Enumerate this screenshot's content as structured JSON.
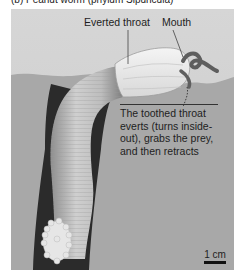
{
  "figure": {
    "cut_caption": "(b) Peanut worm (phylum Sipuncula)",
    "labels": {
      "everted_throat": "Everted throat",
      "mouth": "Mouth"
    },
    "description": "The toothed throat everts (turns inside-out), grabs the prey, and then retracts",
    "scale_bar": "1 cm",
    "colors": {
      "sky": "#d2d2d2",
      "sediment": "#a9a9a9",
      "burrow": "#2a2a2a",
      "worm_body": "#bdbdbd",
      "throat": "#ebebeb"
    }
  }
}
